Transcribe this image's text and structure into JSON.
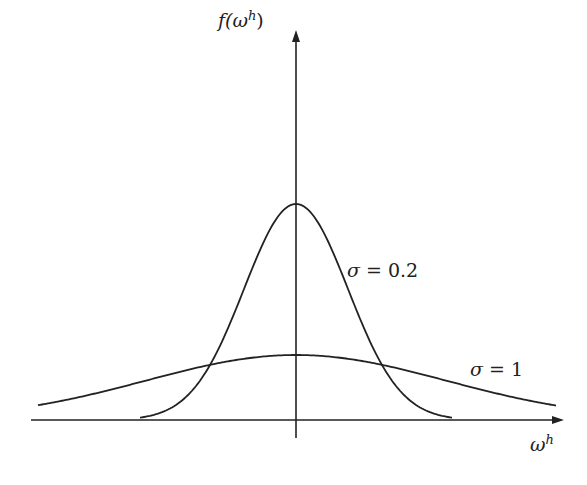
{
  "chart_data": {
    "type": "line",
    "title": "",
    "xlabel": "ω^h",
    "ylabel": "f(ω^h)",
    "grid": false,
    "legend": "inline annotations",
    "series": [
      {
        "name": "σ = 0.2",
        "distribution": "normal",
        "mean": 0,
        "sigma": 0.2,
        "peak_px_y": 204
      },
      {
        "name": "σ = 1",
        "distribution": "normal",
        "mean": 0,
        "sigma": 1,
        "peak_px_y": 355
      }
    ],
    "annotations": [
      "σ = 0.2",
      "σ = 1"
    ]
  },
  "labels": {
    "y_axis": {
      "f": "f(",
      "w": "ω",
      "sup": "h",
      "close": ")"
    },
    "x_axis": {
      "w": "ω",
      "sup": "h"
    },
    "sigma_narrow": {
      "sym": "σ",
      "eq": " = 0.2"
    },
    "sigma_wide": {
      "sym": "σ",
      "eq": " = 1"
    }
  },
  "colors": {
    "line": "#222222",
    "background": "#ffffff"
  }
}
